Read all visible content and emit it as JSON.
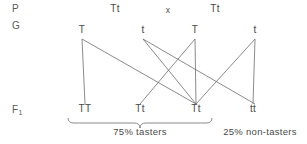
{
  "diagram": {
    "rows": {
      "parent_label": "P",
      "gamete_label": "G",
      "offspring_label": "F",
      "offspring_subscript": "1"
    },
    "parents": {
      "left_genotype": "Tt",
      "cross_symbol": "x",
      "right_genotype": "Tt"
    },
    "gametes": [
      {
        "allele": "T",
        "x": 82
      },
      {
        "allele": "t",
        "x": 143
      },
      {
        "allele": "T",
        "x": 195
      },
      {
        "allele": "t",
        "x": 255
      }
    ],
    "offspring": [
      {
        "genotype": "TT",
        "x": 85
      },
      {
        "genotype": "Tt",
        "x": 140
      },
      {
        "genotype": "Tt",
        "x": 196
      },
      {
        "genotype": "tt",
        "x": 253
      }
    ],
    "ratios": {
      "tasters": "75% tasters",
      "non_tasters": "25% non-tasters"
    },
    "colors": {
      "line": "#6d6d6d",
      "text": "#4a4a4a",
      "background": "#ffffff"
    }
  }
}
